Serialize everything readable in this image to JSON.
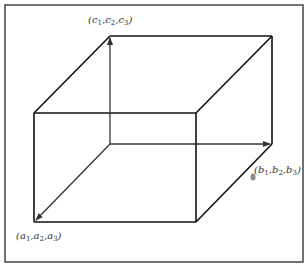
{
  "diagram": {
    "labels": {
      "c": "(c1,c2,c3)",
      "b": "(b1,b2,b3)",
      "a": "(a1,a2,a3)"
    },
    "label_parts": {
      "c": {
        "sym": "c",
        "subs": [
          "1",
          "2",
          "3"
        ]
      },
      "b": {
        "sym": "b",
        "subs": [
          "1",
          "2",
          "3"
        ]
      },
      "a": {
        "sym": "a",
        "subs": [
          "1",
          "2",
          "3"
        ]
      }
    },
    "colors": {
      "edge": "#111111",
      "arrow": "#333333",
      "frame": "#444444",
      "dot": "#777777"
    },
    "vertices": {
      "origin": [
        110,
        144
      ],
      "a": [
        34,
        222
      ],
      "b": [
        272,
        144
      ],
      "c": [
        110,
        36
      ],
      "ab": [
        196,
        222
      ],
      "ac": [
        34,
        113
      ],
      "bc": [
        272,
        36
      ],
      "abc": [
        196,
        113
      ]
    }
  }
}
